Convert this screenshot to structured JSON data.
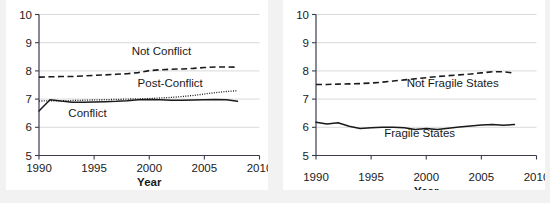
{
  "figure": {
    "panel_count": 2,
    "background": "#f2f2f2",
    "panel_background": "#ffffff",
    "ink_color": "#1a1a1a",
    "grid_color": "#c8c8c8"
  },
  "chart_data": [
    {
      "id": "conflict-panel",
      "type": "line",
      "title": "",
      "xlabel": "Year",
      "ylabel": "",
      "xlim": [
        1990,
        2010
      ],
      "ylim": [
        5,
        10
      ],
      "xticks": [
        1990,
        1995,
        2000,
        2005,
        2010
      ],
      "xtick_labels": [
        "1990",
        "1995",
        "2000",
        "2005",
        "2010"
      ],
      "yticks": [
        5,
        6,
        7,
        8,
        9,
        10
      ],
      "ytick_labels": [
        "5",
        "6",
        "7",
        "8",
        "9",
        "10"
      ],
      "grid": "horizontal",
      "legend_position": "inline-annotations",
      "x": [
        1990,
        1991,
        1992,
        1993,
        1994,
        1995,
        1996,
        1997,
        1998,
        1999,
        2000,
        2001,
        2002,
        2003,
        2004,
        2005,
        2006,
        2007,
        2008
      ],
      "series": [
        {
          "name": "Not Conflict",
          "style": "dashed",
          "label_x": 2001.1,
          "label_y": 8.58,
          "values": [
            7.78,
            7.79,
            7.8,
            7.8,
            7.82,
            7.84,
            7.86,
            7.88,
            7.9,
            7.94,
            8.01,
            8.04,
            8.06,
            8.07,
            8.09,
            8.12,
            8.14,
            8.14,
            8.13
          ]
        },
        {
          "name": "Post-Conflict",
          "style": "dotted",
          "label_x": 2001.9,
          "label_y": 7.44,
          "values": [
            6.93,
            6.94,
            6.94,
            6.95,
            6.96,
            6.97,
            6.98,
            6.99,
            7.0,
            7.01,
            7.02,
            7.04,
            7.06,
            7.09,
            7.13,
            7.18,
            7.23,
            7.27,
            7.3
          ]
        },
        {
          "name": "Conflict",
          "style": "solid",
          "label_x": 1994.4,
          "label_y": 6.38,
          "values": [
            6.58,
            6.98,
            6.93,
            6.89,
            6.89,
            6.9,
            6.91,
            6.92,
            6.94,
            6.98,
            6.99,
            6.98,
            6.96,
            6.96,
            6.97,
            6.98,
            6.99,
            6.98,
            6.92
          ]
        }
      ]
    },
    {
      "id": "fragility-panel",
      "type": "line",
      "title": "",
      "xlabel": "Year",
      "ylabel": "",
      "xlim": [
        1990,
        2010
      ],
      "ylim": [
        5,
        10
      ],
      "xticks": [
        1990,
        1995,
        2000,
        2005,
        2010
      ],
      "xtick_labels": [
        "1990",
        "1995",
        "2000",
        "2005",
        "2010"
      ],
      "yticks": [
        5,
        6,
        7,
        8,
        9,
        10
      ],
      "ytick_labels": [
        "5",
        "6",
        "7",
        "8",
        "9",
        "10"
      ],
      "grid": "horizontal",
      "legend_position": "inline-annotations",
      "x": [
        1990,
        1991,
        1992,
        1993,
        1994,
        1995,
        1996,
        1997,
        1998,
        1999,
        2000,
        2001,
        2002,
        2003,
        2004,
        2005,
        2006,
        2007,
        2008
      ],
      "series": [
        {
          "name": "Not Fragile States",
          "style": "dashed",
          "label_x": 2002.4,
          "label_y": 7.42,
          "values": [
            7.52,
            7.52,
            7.53,
            7.54,
            7.55,
            7.57,
            7.6,
            7.64,
            7.68,
            7.72,
            7.76,
            7.8,
            7.83,
            7.86,
            7.89,
            7.93,
            7.97,
            7.97,
            7.92
          ]
        },
        {
          "name": "Fragile States",
          "style": "solid",
          "label_x": 1999.4,
          "label_y": 5.66,
          "values": [
            6.18,
            6.12,
            6.16,
            6.04,
            5.96,
            5.98,
            6.0,
            6.0,
            5.98,
            5.92,
            5.96,
            5.92,
            5.97,
            6.01,
            6.05,
            6.08,
            6.1,
            6.07,
            6.1
          ]
        }
      ]
    }
  ]
}
